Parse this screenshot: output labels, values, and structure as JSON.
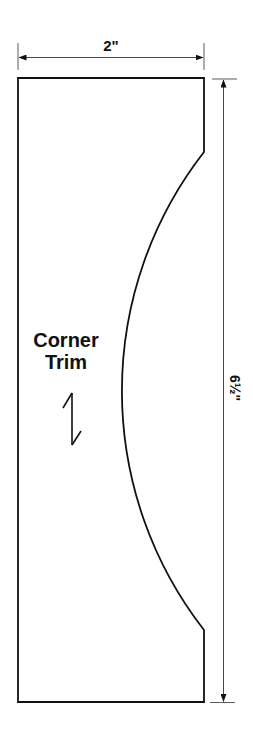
{
  "diagram": {
    "type": "pattern-template",
    "part_label": {
      "line1": "Corner",
      "line2": "Trim"
    },
    "dimensions": {
      "width_label": "2\"",
      "height_label": "6½\""
    },
    "grain_arrow": "grain-direction-arrow",
    "colors": {
      "stroke": "#111111",
      "background": "#ffffff"
    }
  }
}
